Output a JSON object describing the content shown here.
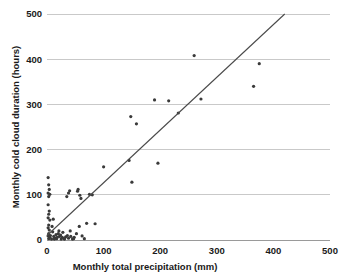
{
  "chart_data": {
    "type": "scatter",
    "title": "",
    "xlabel": "Monthly total precipitation (mm)",
    "ylabel": "Monthly cold cloud duration (hours)",
    "xlim": [
      0,
      500
    ],
    "ylim": [
      0,
      500
    ],
    "xticks": [
      0,
      100,
      200,
      300,
      400,
      500
    ],
    "yticks": [
      0,
      100,
      200,
      300,
      400,
      500
    ],
    "xtick_labels": [
      "0",
      "100",
      "200",
      "300",
      "400",
      "500"
    ],
    "ytick_labels": [
      "0",
      "100",
      "200",
      "300",
      "400",
      "500"
    ],
    "grid": "horizontal",
    "legend": "none",
    "point_color": "#3a3a3a",
    "line_color": "#4a4a4a",
    "grid_color": "#c9c9c9",
    "axis_color": "#9a9a9a",
    "marker_size": 1.6,
    "series": [
      {
        "name": "Monthly observations",
        "points": [
          [
            2,
            138
          ],
          [
            3,
            122
          ],
          [
            4,
            112
          ],
          [
            2,
            104
          ],
          [
            5,
            101
          ],
          [
            3,
            96
          ],
          [
            2,
            78
          ],
          [
            4,
            64
          ],
          [
            3,
            57
          ],
          [
            2,
            49
          ],
          [
            5,
            44
          ],
          [
            3,
            33
          ],
          [
            2,
            27
          ],
          [
            4,
            22
          ],
          [
            3,
            14
          ],
          [
            2,
            9
          ],
          [
            5,
            6
          ],
          [
            3,
            3
          ],
          [
            8,
            2
          ],
          [
            6,
            10
          ],
          [
            10,
            18
          ],
          [
            12,
            8
          ],
          [
            9,
            30
          ],
          [
            14,
            4
          ],
          [
            11,
            46
          ],
          [
            16,
            12
          ],
          [
            13,
            2
          ],
          [
            18,
            6
          ],
          [
            20,
            14
          ],
          [
            17,
            3
          ],
          [
            22,
            8
          ],
          [
            25,
            2
          ],
          [
            21,
            20
          ],
          [
            27,
            6
          ],
          [
            24,
            11
          ],
          [
            30,
            3
          ],
          [
            28,
            17
          ],
          [
            33,
            7
          ],
          [
            31,
            2
          ],
          [
            36,
            10
          ],
          [
            38,
            4
          ],
          [
            35,
            96
          ],
          [
            40,
            109
          ],
          [
            38,
            104
          ],
          [
            42,
            8
          ],
          [
            45,
            2
          ],
          [
            41,
            20
          ],
          [
            48,
            6
          ],
          [
            52,
            14
          ],
          [
            47,
            3
          ],
          [
            55,
            112
          ],
          [
            58,
            99
          ],
          [
            54,
            108
          ],
          [
            60,
            92
          ],
          [
            57,
            30
          ],
          [
            62,
            9
          ],
          [
            66,
            3
          ],
          [
            70,
            37
          ],
          [
            75,
            101
          ],
          [
            80,
            100
          ],
          [
            85,
            36
          ],
          [
            100,
            162
          ],
          [
            145,
            176
          ],
          [
            148,
            273
          ],
          [
            158,
            257
          ],
          [
            150,
            128
          ],
          [
            190,
            310
          ],
          [
            196,
            170
          ],
          [
            215,
            308
          ],
          [
            232,
            281
          ],
          [
            260,
            408
          ],
          [
            272,
            312
          ],
          [
            365,
            340
          ],
          [
            375,
            390
          ]
        ]
      }
    ],
    "trendline": {
      "x_start": 0,
      "y_start": 10,
      "x_end": 420,
      "y_end": 500
    }
  }
}
